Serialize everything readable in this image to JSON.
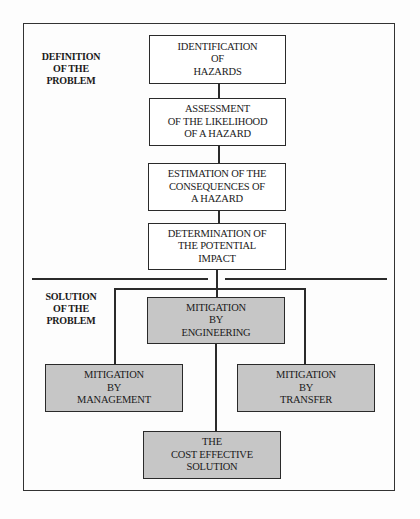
{
  "diagram": {
    "sections": {
      "definition": {
        "label_lines": [
          "DEFINITION",
          "OF THE",
          "PROBLEM"
        ]
      },
      "solution": {
        "label_lines": [
          "SOLUTION",
          "OF THE",
          "PROBLEM"
        ]
      }
    },
    "nodes": {
      "identification": {
        "lines": [
          "IDENTIFICATION",
          "OF",
          "HAZARDS"
        ],
        "shaded": false
      },
      "assessment": {
        "lines": [
          "ASSESSMENT",
          "OF THE LIKELIHOOD",
          "OF A HAZARD"
        ],
        "shaded": false
      },
      "estimation": {
        "lines": [
          "ESTIMATION OF THE",
          "CONSEQUENCES OF",
          "A HAZARD"
        ],
        "shaded": false
      },
      "determination": {
        "lines": [
          "DETERMINATION OF",
          "THE POTENTIAL",
          "IMPACT"
        ],
        "shaded": false
      },
      "engineering": {
        "lines": [
          "MITIGATION",
          "BY",
          "ENGINEERING"
        ],
        "shaded": true
      },
      "management": {
        "lines": [
          "MITIGATION",
          "BY",
          "MANAGEMENT"
        ],
        "shaded": true
      },
      "transfer": {
        "lines": [
          "MITIGATION",
          "BY",
          "TRANSFER"
        ],
        "shaded": true
      },
      "cost_effective": {
        "lines": [
          "THE",
          "COST EFFECTIVE",
          "SOLUTION"
        ],
        "shaded": true
      }
    },
    "edges": [
      {
        "from": "identification",
        "to": "assessment"
      },
      {
        "from": "assessment",
        "to": "estimation"
      },
      {
        "from": "estimation",
        "to": "determination"
      },
      {
        "from": "determination",
        "to": "engineering"
      },
      {
        "from": "determination",
        "to": "management"
      },
      {
        "from": "determination",
        "to": "transfer"
      },
      {
        "from": "engineering",
        "to": "cost_effective"
      }
    ],
    "colors": {
      "shaded_fill": "#c6c6c6",
      "plain_fill": "#ffffff",
      "stroke": "#2a2a2a"
    }
  }
}
